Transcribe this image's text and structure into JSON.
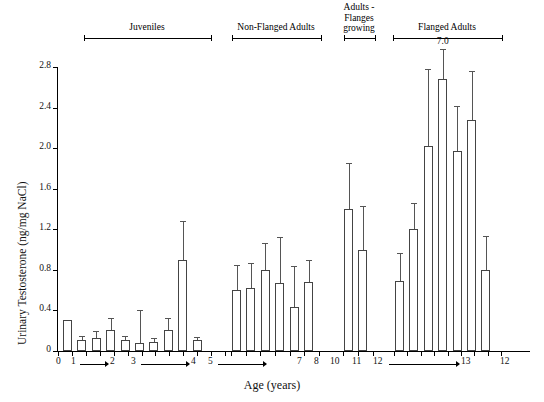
{
  "chart_data": {
    "type": "bar",
    "title": "",
    "xlabel": "Age (years)",
    "ylabel": "Urinary Testosterone (ng/mg NaCl)",
    "ylim": [
      0,
      2.8
    ],
    "yticks": [
      "0",
      "0.4",
      "0.8",
      "1.2",
      "1.6",
      "2.0",
      "2.4",
      "2.8"
    ],
    "grid": false,
    "legend": null,
    "annotations": [
      {
        "text": "7.0",
        "note": "error bar extends above plot area for bar 4 of Flanged Adults"
      }
    ],
    "groups": [
      {
        "name": "Juveniles",
        "age_labels": [
          "0",
          "1",
          "2",
          "3",
          "4",
          "5"
        ],
        "bars": [
          {
            "value": 0.31,
            "error_high": null
          },
          {
            "value": 0.11,
            "error_high": 0.15
          },
          {
            "value": 0.13,
            "error_high": 0.2
          },
          {
            "value": 0.21,
            "error_high": 0.33
          },
          {
            "value": 0.11,
            "error_high": 0.15
          },
          {
            "value": 0.08,
            "error_high": 0.4
          },
          {
            "value": 0.09,
            "error_high": 0.13
          },
          {
            "value": 0.21,
            "error_high": 0.33
          },
          {
            "value": 0.9,
            "error_high": 1.28
          },
          {
            "value": 0.11,
            "error_high": 0.14
          }
        ]
      },
      {
        "name": "Non-Flanged Adults",
        "age_labels": [
          "7",
          "8",
          "10",
          "11",
          "12"
        ],
        "bars": [
          {
            "value": 0.6,
            "error_high": 0.85
          },
          {
            "value": 0.62,
            "error_high": 0.87
          },
          {
            "value": 0.8,
            "error_high": 1.06
          },
          {
            "value": 0.67,
            "error_high": 1.12
          },
          {
            "value": 0.43,
            "error_high": 0.84
          },
          {
            "value": 0.68,
            "error_high": 0.9
          }
        ]
      },
      {
        "name": "Adults - Flanges growing",
        "age_labels": [
          "13"
        ],
        "bars": [
          {
            "value": 1.4,
            "error_high": 1.85
          },
          {
            "value": 1.0,
            "error_high": 1.43
          }
        ]
      },
      {
        "name": "Flanged Adults",
        "age_labels": [
          "12",
          "13",
          "15",
          "16"
        ],
        "bars": [
          {
            "value": 0.69,
            "error_high": 0.97
          },
          {
            "value": 1.2,
            "error_high": 1.46
          },
          {
            "value": 2.02,
            "error_high": 2.78
          },
          {
            "value": 2.68,
            "error_high": 7.0,
            "error_label": "7.0"
          },
          {
            "value": 1.97,
            "error_high": 2.42
          },
          {
            "value": 2.28,
            "error_high": 2.76
          },
          {
            "value": 0.8,
            "error_high": 1.13
          }
        ]
      }
    ]
  },
  "axis": {
    "y_title": "Urinary Testosterone (ng/mg NaCl)",
    "x_title": "Age (years)",
    "y_ticks": [
      "2.8",
      "2.4",
      "2.0",
      "1.6",
      "1.2",
      "0.8",
      "0.4",
      "0"
    ]
  },
  "group_headers": [
    {
      "label": "Juveniles"
    },
    {
      "label": "Non-Flanged Adults"
    },
    {
      "label": "Adults -\nFlanges\ngrowing",
      "line1": "Adults -",
      "line2": "Flanges",
      "line3": "growing"
    },
    {
      "label": "Flanged Adults"
    }
  ],
  "x_axis_groups": [
    {
      "marks": [
        "0",
        "1",
        "2",
        "3",
        "4",
        "5"
      ]
    },
    {
      "marks": [
        "7",
        "8",
        "10",
        "11",
        "12",
        "13"
      ]
    },
    {
      "marks": [
        "12",
        "13",
        "15",
        "16"
      ]
    }
  ],
  "annotation_label": "7.0"
}
